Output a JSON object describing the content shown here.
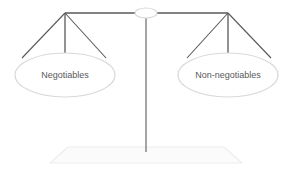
{
  "diagram": {
    "type": "balance-scale-diagram",
    "background_color": "#ffffff",
    "pans": [
      {
        "id": "left-pan",
        "label": "Negotiables",
        "side": "left",
        "center_x": 65,
        "center_y": 75,
        "radius_x": 50,
        "radius_y": 22
      },
      {
        "id": "right-pan",
        "label": "Non-negotiables",
        "side": "right",
        "center_x": 228,
        "center_y": 75,
        "radius_x": 50,
        "radius_y": 22
      }
    ],
    "colors": {
      "beam": "#595959",
      "post": "#7f7f7f",
      "string": "#595959",
      "pan_outline": "#d9d9d9",
      "base_outline": "#ededed",
      "base_fill": "#fbfbfb",
      "pivot_outline": "#d9d9d9",
      "label_text": "#595959"
    },
    "beam": {
      "left_end_x": 65,
      "right_end_x": 228,
      "y": 13
    },
    "pivot": {
      "center_x": 146,
      "center_y": 13,
      "radius_x": 11,
      "radius_y": 5
    },
    "post": {
      "x": 146,
      "top_y": 13,
      "bottom_y": 152
    },
    "base": {
      "top_left_x": 68,
      "top_right_x": 224,
      "top_y": 147,
      "bottom_left_x": 50,
      "bottom_right_x": 242,
      "bottom_y": 163
    }
  }
}
